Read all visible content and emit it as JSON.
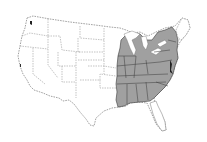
{
  "map": {
    "title": "",
    "region": "Contiguous United States",
    "shaded_region": "Eastern United States",
    "colors": {
      "background": "#ffffff",
      "unshaded_fill": "#ffffff",
      "shaded_fill": "#a0a0a0",
      "border": "#8a8a8a",
      "shaded_border": "#3a3a3a",
      "dark_accent": "#222222"
    },
    "legend": []
  }
}
